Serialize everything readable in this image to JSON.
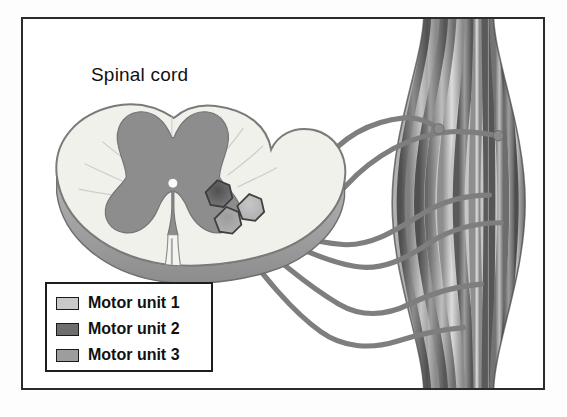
{
  "figure": {
    "title_label": "Spinal cord",
    "alt_summary": "Diagram of three motor units: motor neuron cell bodies in the ventral horn of the spinal cord send axons to separate groups of skeletal muscle fibers.",
    "frame_color": "#2b2b2b",
    "background_color": "#ffffff"
  },
  "legend": {
    "border_color": "#1d1d1d",
    "items": [
      {
        "label": "Motor unit 1",
        "color": "#c9c9c9",
        "swatch_name": "legend-swatch-unit-1"
      },
      {
        "label": "Motor unit 2",
        "color": "#6e6e6e",
        "swatch_name": "legend-swatch-unit-2"
      },
      {
        "label": "Motor unit 3",
        "color": "#9d9d9d",
        "swatch_name": "legend-swatch-unit-3"
      }
    ]
  },
  "spinal_cord": {
    "white_matter_color": "#f1f1ec",
    "gray_matter_color": "#8d8d8d",
    "outline_color": "#6b6b6b",
    "rim_shadow_color": "#9a9a9a",
    "central_canal_color": "#fbfbf8",
    "parts": [
      "white matter",
      "gray matter (butterfly)",
      "dorsal horn",
      "ventral horn",
      "central canal",
      "anterior median fissure"
    ]
  },
  "motor_neurons": [
    {
      "name": "motor-neuron-soma-unit-2",
      "unit": "Motor unit 2",
      "color": "#6e6e6e",
      "cx": 196,
      "cy": 176
    },
    {
      "name": "motor-neuron-soma-unit-1",
      "unit": "Motor unit 1",
      "color": "#c0c0c0",
      "cx": 228,
      "cy": 190
    },
    {
      "name": "motor-neuron-soma-unit-3",
      "unit": "Motor unit 3",
      "color": "#9d9d9d",
      "cx": 205,
      "cy": 203
    }
  ],
  "muscle": {
    "name": "skeletal-muscle-belly",
    "shape": "fusiform",
    "fiber_light_color": "#cfcfcf",
    "fiber_dark_color": "#6f6f6f",
    "fiber_count": 11,
    "endplates": [
      {
        "name": "motor-endplate-1",
        "x": 419,
        "y": 111
      },
      {
        "name": "motor-endplate-2",
        "x": 479,
        "y": 118
      }
    ]
  },
  "axons": {
    "color": "#7b7b7b",
    "count": 6,
    "description": "Axons leave the ventral horn and curve to the right, branching onto separate muscle fibers."
  }
}
